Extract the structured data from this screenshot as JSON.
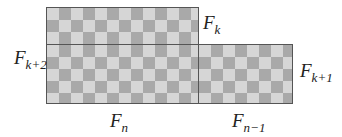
{
  "diagram": {
    "shapes": [
      {
        "id": "top-rect",
        "desc": "checkerboard rectangle Fk x Fn"
      },
      {
        "id": "bottom-left-rect",
        "desc": "checkerboard rectangle Fk+1 x Fn"
      },
      {
        "id": "bottom-right-rect",
        "desc": "checkerboard rectangle Fk+1 x Fn-1"
      }
    ],
    "labels": {
      "fk": {
        "base": "F",
        "sub": "k"
      },
      "fk2": {
        "base": "F",
        "sub": "k+2"
      },
      "fk1": {
        "base": "F",
        "sub": "k+1"
      },
      "fn": {
        "base": "F",
        "sub": "n"
      },
      "fn1": {
        "base": "F",
        "sub": "n−1"
      }
    },
    "colors": {
      "light": "#d6d6d6",
      "dark": "#a9a9a9",
      "border": "#555555"
    }
  }
}
